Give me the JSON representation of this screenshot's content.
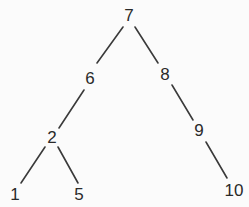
{
  "diagram": {
    "type": "binary-tree",
    "root": "7",
    "nodes": [
      {
        "id": "n7",
        "label": "7",
        "x": 129,
        "y": 15
      },
      {
        "id": "n6",
        "label": "6",
        "x": 90,
        "y": 78
      },
      {
        "id": "n8",
        "label": "8",
        "x": 165,
        "y": 74
      },
      {
        "id": "n2",
        "label": "2",
        "x": 52,
        "y": 137
      },
      {
        "id": "n9",
        "label": "9",
        "x": 199,
        "y": 130
      },
      {
        "id": "n1",
        "label": "1",
        "x": 15,
        "y": 194
      },
      {
        "id": "n5",
        "label": "5",
        "x": 79,
        "y": 194
      },
      {
        "id": "n10",
        "label": "10",
        "x": 234,
        "y": 190
      }
    ],
    "edges": [
      {
        "from": "7",
        "to": "6",
        "x1": 123,
        "y1": 27,
        "x2": 97,
        "y2": 63
      },
      {
        "from": "7",
        "to": "8",
        "x1": 135,
        "y1": 27,
        "x2": 158,
        "y2": 63
      },
      {
        "from": "6",
        "to": "2",
        "x1": 84,
        "y1": 90,
        "x2": 59,
        "y2": 128
      },
      {
        "from": "8",
        "to": "9",
        "x1": 172,
        "y1": 85,
        "x2": 193,
        "y2": 120
      },
      {
        "from": "2",
        "to": "1",
        "x1": 45,
        "y1": 147,
        "x2": 21,
        "y2": 183
      },
      {
        "from": "2",
        "to": "5",
        "x1": 58,
        "y1": 147,
        "x2": 78,
        "y2": 183
      },
      {
        "from": "9",
        "to": "10",
        "x1": 206,
        "y1": 142,
        "x2": 227,
        "y2": 178
      }
    ],
    "colors": {
      "background": "#fbfbfb",
      "edge": "#3a3a3a",
      "text": "#2a2a2a"
    }
  }
}
